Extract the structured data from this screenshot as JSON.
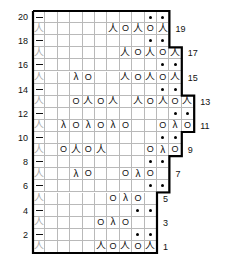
{
  "chart": {
    "title": "",
    "type": "knitting-stitch-chart",
    "geometry": {
      "x0": 33,
      "y0": 11,
      "cell_w": 12.4,
      "cell_h": 12.1,
      "rows": 20,
      "max_cols": 13
    },
    "symbol_legend": {
      "dash": "purl / no-stitch-dash",
      "dot": "bead-dot",
      "yo": "yarn-over",
      "k2tog": "right-leaning-decrease",
      "ssk": "left-leaning-decrease",
      "blank": "knit"
    },
    "symbols": {
      "dash": "–",
      "dot": "●",
      "yo": "O",
      "k2tog": "人",
      "ssk": "λ"
    },
    "row_numbers_left": [
      "20",
      "18",
      "16",
      "14",
      "12",
      "10",
      "8",
      "6",
      "4",
      "2"
    ],
    "row_numbers_right": [
      "19",
      "17",
      "15",
      "13",
      "11",
      "9",
      "7",
      "5",
      "3",
      "1"
    ],
    "rows": [
      {
        "num": 20,
        "cols": 11,
        "cells": [
          "dash",
          "",
          "",
          "",
          "",
          "",
          "",
          "",
          "",
          "dot",
          "dot"
        ]
      },
      {
        "num": 19,
        "cols": 11,
        "cells": [
          "k2tog_faint",
          "",
          "",
          "",
          "",
          "",
          "k2tog",
          "yo",
          "k2tog",
          "yo",
          "k2tog"
        ]
      },
      {
        "num": 18,
        "cols": 11,
        "cells": [
          "dash",
          "",
          "",
          "",
          "",
          "",
          "",
          "",
          "",
          "dot",
          "dot"
        ]
      },
      {
        "num": 17,
        "cols": 12,
        "cells": [
          "k2tog_faint",
          "",
          "",
          "",
          "",
          "",
          "",
          "k2tog",
          "yo",
          "k2tog",
          "yo",
          "k2tog"
        ]
      },
      {
        "num": 16,
        "cols": 12,
        "cells": [
          "dash",
          "",
          "",
          "",
          "",
          "",
          "",
          "",
          "",
          "",
          "dot",
          "dot"
        ]
      },
      {
        "num": 15,
        "cols": 12,
        "cells": [
          "k2tog_faint",
          "",
          "",
          "ssk",
          "yo",
          "",
          "",
          "k2tog",
          "yo",
          "k2tog",
          "yo",
          "k2tog"
        ]
      },
      {
        "num": 14,
        "cols": 12,
        "cells": [
          "dash",
          "",
          "",
          "",
          "",
          "",
          "",
          "",
          "",
          "",
          "dot",
          "dot"
        ]
      },
      {
        "num": 13,
        "cols": 13,
        "cells": [
          "k2tog_faint",
          "",
          "",
          "yo",
          "k2tog",
          "yo",
          "k2tog",
          "",
          "k2tog",
          "yo",
          "k2tog",
          "yo",
          "k2tog"
        ]
      },
      {
        "num": 12,
        "cols": 13,
        "cells": [
          "dash",
          "",
          "",
          "",
          "",
          "",
          "",
          "",
          "",
          "",
          "",
          "dot",
          "dot"
        ]
      },
      {
        "num": 11,
        "cols": 13,
        "cells": [
          "k2tog_faint",
          "",
          "ssk",
          "yo",
          "ssk",
          "yo",
          "ssk",
          "yo",
          "",
          "",
          "yo",
          "ssk",
          "yo"
        ]
      },
      {
        "num": 10,
        "cols": 12,
        "cells": [
          "dash",
          "",
          "",
          "",
          "",
          "",
          "",
          "",
          "",
          "",
          "dot",
          "dot"
        ]
      },
      {
        "num": 9,
        "cols": 12,
        "cells": [
          "k2tog_faint",
          "",
          "yo",
          "k2tog",
          "yo",
          "k2tog",
          "",
          "",
          "",
          "yo",
          "ssk",
          "yo"
        ]
      },
      {
        "num": 8,
        "cols": 11,
        "cells": [
          "dash",
          "",
          "",
          "",
          "",
          "",
          "",
          "",
          "",
          "dot",
          "dot"
        ]
      },
      {
        "num": 7,
        "cols": 11,
        "cells": [
          "k2tog_faint",
          "",
          "",
          "ssk",
          "yo",
          "",
          "",
          "yo",
          "ssk",
          "yo",
          ""
        ]
      },
      {
        "num": 6,
        "cols": 11,
        "cells": [
          "dash",
          "",
          "",
          "",
          "",
          "",
          "",
          "",
          "",
          "dot",
          "dot"
        ]
      },
      {
        "num": 5,
        "cols": 10,
        "cells": [
          "k2tog_faint",
          "",
          "",
          "",
          "",
          "",
          "yo",
          "ssk",
          "yo",
          ""
        ]
      },
      {
        "num": 4,
        "cols": 10,
        "cells": [
          "dash",
          "",
          "",
          "",
          "",
          "",
          "",
          "",
          "dot",
          "dot"
        ]
      },
      {
        "num": 3,
        "cols": 10,
        "cells": [
          "k2tog_faint",
          "",
          "",
          "",
          "",
          "yo",
          "ssk",
          "yo",
          "",
          ""
        ]
      },
      {
        "num": 2,
        "cols": 10,
        "cells": [
          "dash",
          "",
          "",
          "",
          "",
          "",
          "",
          "",
          "dot",
          "dot"
        ]
      },
      {
        "num": 1,
        "cols": 10,
        "cells": [
          "k2tog_faint",
          "",
          "",
          "",
          "",
          "k2tog",
          "yo",
          "k2tog",
          "yo",
          "k2tog"
        ]
      }
    ]
  }
}
